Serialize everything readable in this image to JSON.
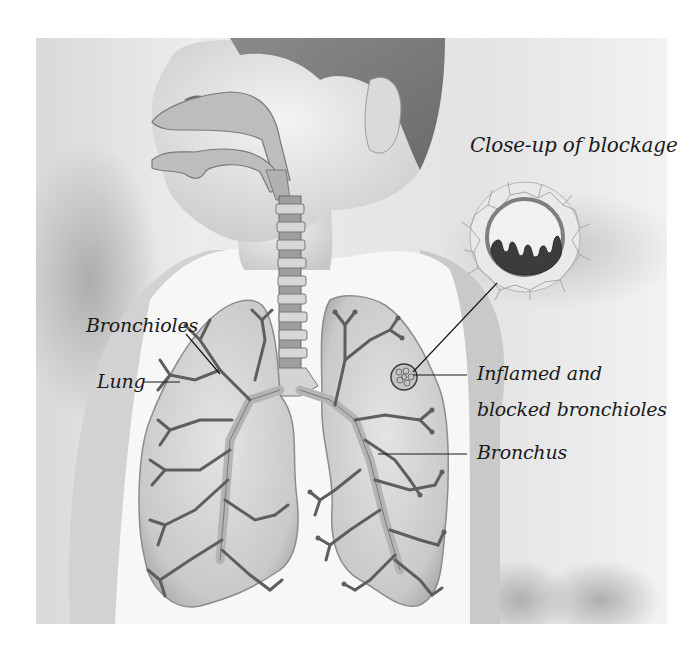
{
  "diagram": {
    "colors": {
      "page_background": "#ffffff",
      "ink": "#1a1a1a",
      "lung_fill": "#cfcfcf",
      "airway_fill": "#a9a9a9",
      "blockage_fill": "#3c3c3c"
    },
    "labels": {
      "closeup_title": "Close-up of blockage",
      "bronchioles": "Bronchioles",
      "lung": "Lung",
      "inflamed_line1": "Inflamed and",
      "inflamed_line2": "blocked bronchioles",
      "bronchus": "Bronchus"
    },
    "parts": [
      "nasal-cavity",
      "oral-cavity",
      "trachea",
      "left-lung",
      "right-lung",
      "bronchial-tree",
      "blockage-closeup"
    ]
  }
}
